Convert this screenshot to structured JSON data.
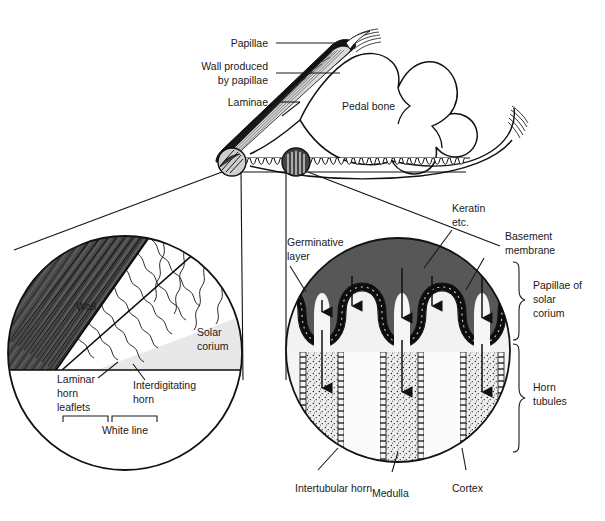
{
  "figure": {
    "background": "#ffffff",
    "ink": "#1a1a1a"
  },
  "colors": {
    "wall_dark": "#4a4a4a",
    "keratin_dark": "#575757",
    "solar_corium_light": "#e8e8e8",
    "papilla_light": "#f2f2f2",
    "medulla_stipple_bg": "#ededed",
    "white": "#ffffff",
    "outline": "#111111"
  },
  "top_diagram": {
    "name": "sagittal-hoof-section",
    "labels": [
      {
        "id": "papillae",
        "text": "Papillae",
        "x": 268,
        "y": 47
      },
      {
        "id": "wall-produced-by-papillae-1",
        "text": "Wall produced",
        "x": 268,
        "y": 70
      },
      {
        "id": "wall-produced-by-papillae-2",
        "text": "by papillae",
        "x": 268,
        "y": 84
      },
      {
        "id": "laminae",
        "text": "Laminae",
        "x": 268,
        "y": 106
      },
      {
        "id": "pedal-bone",
        "text": "Pedal bone",
        "x": 342,
        "y": 110
      }
    ]
  },
  "left_inset": {
    "name": "white-line-inset",
    "labels": [
      {
        "id": "wall",
        "text": "Wall",
        "x": 88,
        "y": 306
      },
      {
        "id": "solar-corium-1",
        "text": "Solar",
        "x": 197,
        "y": 336
      },
      {
        "id": "solar-corium-2",
        "text": "corium",
        "x": 197,
        "y": 350
      },
      {
        "id": "laminar-horn-leaflets-1",
        "text": "Laminar",
        "x": 57,
        "y": 383
      },
      {
        "id": "laminar-horn-leaflets-2",
        "text": "horn",
        "x": 57,
        "y": 397
      },
      {
        "id": "laminar-horn-leaflets-3",
        "text": "leaflets",
        "x": 57,
        "y": 411
      },
      {
        "id": "interdigitating-horn-1",
        "text": "Interdigitating",
        "x": 133,
        "y": 389
      },
      {
        "id": "interdigitating-horn-2",
        "text": "horn",
        "x": 133,
        "y": 403
      },
      {
        "id": "white-line",
        "text": "White line",
        "x": 125,
        "y": 430
      }
    ]
  },
  "right_inset": {
    "name": "horn-tubule-inset",
    "labels": [
      {
        "id": "germinative-layer-1",
        "text": "Germinative",
        "x": 287,
        "y": 246
      },
      {
        "id": "germinative-layer-2",
        "text": "layer",
        "x": 287,
        "y": 260
      },
      {
        "id": "keratin-1",
        "text": "Keratin",
        "x": 452,
        "y": 212
      },
      {
        "id": "keratin-2",
        "text": "etc.",
        "x": 452,
        "y": 226
      },
      {
        "id": "basement-membrane-1",
        "text": "Basement",
        "x": 505,
        "y": 240
      },
      {
        "id": "basement-membrane-2",
        "text": "membrane",
        "x": 505,
        "y": 254
      },
      {
        "id": "papillae-of-solar-corium-1",
        "text": "Papillae of",
        "x": 535,
        "y": 289
      },
      {
        "id": "papillae-of-solar-corium-2",
        "text": "solar",
        "x": 535,
        "y": 303
      },
      {
        "id": "papillae-of-solar-corium-3",
        "text": "corium",
        "x": 535,
        "y": 317
      },
      {
        "id": "horn-tubules-1",
        "text": "Horn",
        "x": 535,
        "y": 391
      },
      {
        "id": "horn-tubules-2",
        "text": "tubules",
        "x": 535,
        "y": 405
      },
      {
        "id": "intertubular-horn",
        "text": "Intertubular horn",
        "x": 295,
        "y": 492
      },
      {
        "id": "medulla",
        "text": "Medulla",
        "x": 395,
        "y": 497
      },
      {
        "id": "cortex",
        "text": "Cortex",
        "x": 470,
        "y": 492
      }
    ]
  }
}
